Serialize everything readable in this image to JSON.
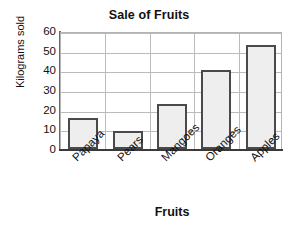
{
  "chart_data": {
    "type": "bar",
    "title": "Sale of Fruits",
    "xlabel": "Fruits",
    "ylabel": "Kilograms sold",
    "categories": [
      "Papaya",
      "Pears",
      "Mangoes",
      "Oranges",
      "Apples"
    ],
    "values": [
      16,
      9,
      23,
      40,
      53
    ],
    "ylim": [
      0,
      60
    ],
    "yticks": [
      0,
      10,
      20,
      30,
      40,
      50,
      60
    ],
    "ytick_labels": [
      "0",
      "10",
      "20",
      "30",
      "40",
      "50",
      "60"
    ],
    "grid": true,
    "legend": null,
    "legend_position": "none",
    "bar_fill_color": "#eeeeee",
    "bar_border_color": "#4a4a4a",
    "grid_color": "#bbbbbb",
    "axis_color": "#3a3a3a",
    "text_color": "#111111",
    "background_color": "#ffffff",
    "xtick_rotation_degrees": -45
  }
}
